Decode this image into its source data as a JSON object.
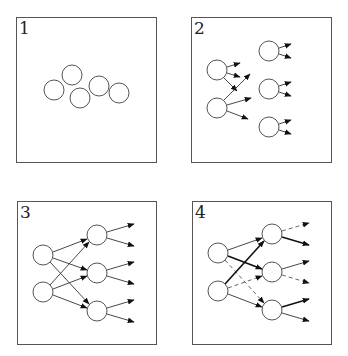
{
  "panels": [
    {
      "label": "1",
      "frame": {
        "x": 16,
        "y": 17,
        "w": 140,
        "h": 145
      },
      "nodes": [
        {
          "cx": 54,
          "cy": 90
        },
        {
          "cx": 72,
          "cy": 75
        },
        {
          "cx": 80,
          "cy": 98
        },
        {
          "cx": 99,
          "cy": 86
        },
        {
          "cx": 119,
          "cy": 93
        }
      ],
      "edges": []
    },
    {
      "label": "2",
      "frame": {
        "x": 191,
        "y": 17,
        "w": 140,
        "h": 145
      },
      "nodes": [
        {
          "cx": 217,
          "cy": 70
        },
        {
          "cx": 217,
          "cy": 108
        },
        {
          "cx": 269,
          "cy": 51
        },
        {
          "cx": 269,
          "cy": 89
        },
        {
          "cx": 269,
          "cy": 127
        }
      ],
      "edges": [
        {
          "x1": 227,
          "y1": 67,
          "x2": 240,
          "y2": 63,
          "style": "normal"
        },
        {
          "x1": 227,
          "y1": 73,
          "x2": 240,
          "y2": 77,
          "style": "normal"
        },
        {
          "x1": 224,
          "y1": 78,
          "x2": 237,
          "y2": 91,
          "style": "normal"
        },
        {
          "x1": 224,
          "y1": 100,
          "x2": 250,
          "y2": 74,
          "style": "normal"
        },
        {
          "x1": 227,
          "y1": 105,
          "x2": 251,
          "y2": 98,
          "style": "normal"
        },
        {
          "x1": 227,
          "y1": 111,
          "x2": 248,
          "y2": 119,
          "style": "normal"
        },
        {
          "x1": 279,
          "y1": 48,
          "x2": 291,
          "y2": 44,
          "style": "normal"
        },
        {
          "x1": 279,
          "y1": 54,
          "x2": 291,
          "y2": 58,
          "style": "normal"
        },
        {
          "x1": 279,
          "y1": 86,
          "x2": 291,
          "y2": 82,
          "style": "normal"
        },
        {
          "x1": 279,
          "y1": 92,
          "x2": 291,
          "y2": 96,
          "style": "normal"
        },
        {
          "x1": 279,
          "y1": 124,
          "x2": 291,
          "y2": 120,
          "style": "normal"
        },
        {
          "x1": 279,
          "y1": 130,
          "x2": 291,
          "y2": 134,
          "style": "normal"
        }
      ]
    },
    {
      "label": "3",
      "frame": {
        "x": 17,
        "y": 201,
        "w": 139,
        "h": 143
      },
      "nodes": [
        {
          "cx": 43,
          "cy": 255
        },
        {
          "cx": 43,
          "cy": 292
        },
        {
          "cx": 97,
          "cy": 235
        },
        {
          "cx": 97,
          "cy": 273
        },
        {
          "cx": 97,
          "cy": 311
        }
      ],
      "edges": [
        {
          "x1": 53,
          "y1": 252,
          "x2": 87,
          "y2": 239,
          "style": "normal"
        },
        {
          "x1": 53,
          "y1": 258,
          "x2": 87,
          "y2": 270,
          "style": "normal"
        },
        {
          "x1": 50,
          "y1": 262,
          "x2": 89,
          "y2": 304,
          "style": "normal"
        },
        {
          "x1": 50,
          "y1": 285,
          "x2": 89,
          "y2": 242,
          "style": "normal"
        },
        {
          "x1": 53,
          "y1": 289,
          "x2": 87,
          "y2": 276,
          "style": "normal"
        },
        {
          "x1": 53,
          "y1": 295,
          "x2": 87,
          "y2": 308,
          "style": "normal"
        },
        {
          "x1": 107,
          "y1": 232,
          "x2": 134,
          "y2": 224,
          "style": "normal"
        },
        {
          "x1": 107,
          "y1": 238,
          "x2": 134,
          "y2": 246,
          "style": "normal"
        },
        {
          "x1": 107,
          "y1": 270,
          "x2": 134,
          "y2": 262,
          "style": "normal"
        },
        {
          "x1": 107,
          "y1": 276,
          "x2": 134,
          "y2": 284,
          "style": "normal"
        },
        {
          "x1": 107,
          "y1": 308,
          "x2": 134,
          "y2": 300,
          "style": "normal"
        },
        {
          "x1": 107,
          "y1": 314,
          "x2": 134,
          "y2": 322,
          "style": "normal"
        }
      ]
    },
    {
      "label": "4",
      "frame": {
        "x": 192,
        "y": 201,
        "w": 139,
        "h": 143
      },
      "nodes": [
        {
          "cx": 218,
          "cy": 253
        },
        {
          "cx": 218,
          "cy": 291
        },
        {
          "cx": 272,
          "cy": 234
        },
        {
          "cx": 272,
          "cy": 272
        },
        {
          "cx": 272,
          "cy": 310
        }
      ],
      "edges": [
        {
          "x1": 228,
          "y1": 250,
          "x2": 262,
          "y2": 238,
          "style": "normal"
        },
        {
          "x1": 228,
          "y1": 256,
          "x2": 262,
          "y2": 269,
          "style": "bold"
        },
        {
          "x1": 225,
          "y1": 260,
          "x2": 264,
          "y2": 303,
          "style": "dashed"
        },
        {
          "x1": 225,
          "y1": 284,
          "x2": 264,
          "y2": 241,
          "style": "bold"
        },
        {
          "x1": 228,
          "y1": 288,
          "x2": 262,
          "y2": 276,
          "style": "dashed"
        },
        {
          "x1": 228,
          "y1": 294,
          "x2": 262,
          "y2": 307,
          "style": "normal"
        },
        {
          "x1": 282,
          "y1": 231,
          "x2": 309,
          "y2": 223,
          "style": "dashed"
        },
        {
          "x1": 282,
          "y1": 237,
          "x2": 309,
          "y2": 245,
          "style": "bold"
        },
        {
          "x1": 282,
          "y1": 269,
          "x2": 309,
          "y2": 261,
          "style": "normal"
        },
        {
          "x1": 282,
          "y1": 275,
          "x2": 309,
          "y2": 283,
          "style": "dashed"
        },
        {
          "x1": 282,
          "y1": 307,
          "x2": 309,
          "y2": 299,
          "style": "bold"
        },
        {
          "x1": 282,
          "y1": 313,
          "x2": 309,
          "y2": 321,
          "style": "normal"
        }
      ]
    }
  ],
  "node_radius": 10
}
